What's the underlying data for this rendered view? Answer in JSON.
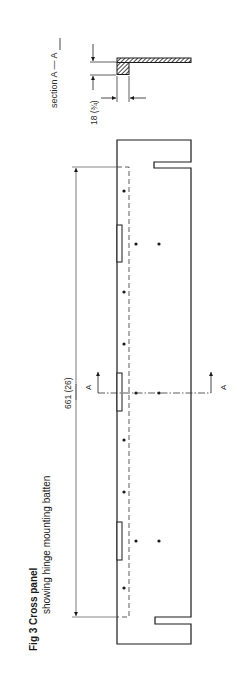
{
  "figure": {
    "title_bold": "Fig 3  Cross panel",
    "subtitle": "showing hinge mounting batten"
  },
  "section_view": {
    "label": "section A — A",
    "thickness_dimension": "18 (¾)"
  },
  "main_view": {
    "length_dimension": "661 (26)",
    "section_marker_left": "A",
    "section_marker_right": "A",
    "hinge_recess_count": 3,
    "screw_hole_count": 11
  },
  "colors": {
    "line": "#1a1a1a",
    "dim_line": "#555555",
    "background": "#ffffff"
  }
}
